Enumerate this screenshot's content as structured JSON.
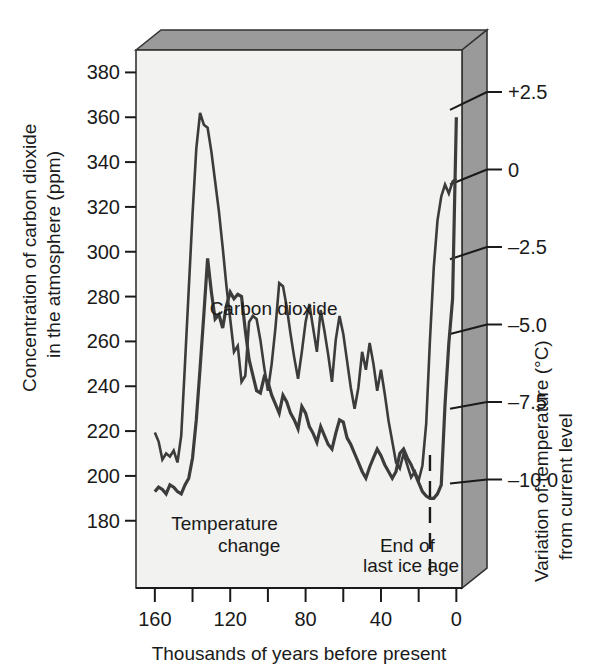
{
  "figure": {
    "background_color": "#ffffff",
    "plot_face_color": "#f2f2f0",
    "box_shade_color": "#9a9a9a",
    "line_color": "#3c3c3c",
    "axis_color": "#1a1a1a"
  },
  "chart_data": {
    "type": "line",
    "title": "",
    "xlabel": "Thousands of years before present",
    "ylabel": "Concentration of carbon dioxide in the atmosphere (ppm)",
    "ylabel_line1": "Concentration of carbon dioxide",
    "ylabel_line2": "in the atmosphere (ppm)",
    "y2label": "Variation of temperature (°C) from current level",
    "y2label_line1": "Variation of temperature (°C)",
    "y2label_line2": "from current level",
    "xlim": [
      170,
      -3
    ],
    "x_inverted": true,
    "ylim": [
      150,
      390
    ],
    "y2lim": [
      -13.5,
      4.5
    ],
    "grid": false,
    "legend": "inline-labels",
    "xticks": [
      160,
      140,
      120,
      100,
      80,
      60,
      40,
      20,
      0
    ],
    "xticklabels": [
      "160",
      "",
      "120",
      "",
      "80",
      "",
      "40",
      "",
      "0"
    ],
    "yticks": [
      180,
      200,
      220,
      240,
      260,
      280,
      300,
      320,
      340,
      360,
      380
    ],
    "yticklabels": [
      "180",
      "200",
      "220",
      "240",
      "260",
      "280",
      "300",
      "320",
      "340",
      "360",
      "380"
    ],
    "y2ticks": [
      2.5,
      0,
      -2.5,
      -5.0,
      -7.5,
      -10.0
    ],
    "y2ticklabels": [
      "+2.5",
      "0",
      "–2.5",
      "–5.0",
      "–7.5",
      "–10.0"
    ],
    "annotations": [
      {
        "text": "Carbon dioxide",
        "x": 97,
        "y": 272
      },
      {
        "text": "Temperature",
        "x": 123,
        "y": 176
      },
      {
        "text": "change",
        "x": 110,
        "y": 166
      },
      {
        "text": "End of",
        "x": 26,
        "y": 166
      },
      {
        "text": "last ice age",
        "x": 24,
        "y": 157
      }
    ],
    "marker_line": {
      "label": "End of last ice age",
      "x": 14,
      "style": "dashed"
    },
    "series": [
      {
        "name": "Carbon dioxide",
        "axis": "left",
        "unit": "ppm",
        "x": [
          160,
          158,
          156,
          154,
          152,
          150,
          148,
          146,
          144,
          142,
          140,
          138,
          136,
          134,
          132,
          130,
          128,
          126,
          124,
          122,
          120,
          118,
          116,
          114,
          112,
          110,
          108,
          106,
          104,
          102,
          100,
          98,
          96,
          94,
          92,
          90,
          88,
          86,
          84,
          82,
          80,
          78,
          76,
          74,
          72,
          70,
          68,
          66,
          64,
          62,
          60,
          58,
          56,
          54,
          52,
          50,
          48,
          46,
          44,
          42,
          40,
          38,
          36,
          34,
          32,
          30,
          28,
          26,
          24,
          22,
          20,
          18,
          16,
          14,
          12,
          10,
          8,
          6,
          4,
          2,
          0
        ],
        "values": [
          193,
          195,
          194,
          192,
          196,
          195,
          193,
          192,
          196,
          199,
          208,
          225,
          248,
          272,
          297,
          282,
          270,
          272,
          266,
          276,
          282,
          279,
          281,
          280,
          265,
          252,
          245,
          238,
          237,
          244,
          242,
          236,
          232,
          228,
          236,
          233,
          228,
          225,
          221,
          231,
          228,
          222,
          219,
          215,
          222,
          218,
          214,
          212,
          219,
          225,
          224,
          217,
          214,
          210,
          206,
          202,
          199,
          204,
          208,
          212,
          209,
          205,
          202,
          199,
          202,
          210,
          212,
          208,
          205,
          201,
          197,
          193,
          191,
          190,
          190,
          192,
          196,
          232,
          259,
          279,
          360
        ]
      },
      {
        "name": "Temperature change",
        "axis": "right",
        "unit": "°C",
        "x": [
          160,
          158,
          156,
          154,
          152,
          150,
          148,
          146,
          144,
          142,
          140,
          138,
          136,
          134,
          132,
          130,
          128,
          126,
          124,
          122,
          120,
          118,
          116,
          114,
          112,
          110,
          108,
          106,
          104,
          102,
          100,
          98,
          96,
          94,
          92,
          90,
          88,
          86,
          84,
          82,
          80,
          78,
          76,
          74,
          72,
          70,
          68,
          66,
          64,
          62,
          60,
          58,
          56,
          54,
          52,
          50,
          48,
          46,
          44,
          42,
          40,
          38,
          36,
          34,
          32,
          30,
          28,
          26,
          24,
          22,
          20,
          18,
          16,
          14,
          12,
          10,
          8,
          6,
          4,
          2,
          0
        ],
        "values": [
          -8.3,
          -8.6,
          -9.2,
          -9.0,
          -9.1,
          -8.9,
          -9.3,
          -8.4,
          -6.0,
          -3.5,
          -1.0,
          1.2,
          2.4,
          2.0,
          1.9,
          1.1,
          0.1,
          -0.9,
          -2.1,
          -3.4,
          -4.5,
          -5.6,
          -5.4,
          -6.6,
          -6.4,
          -4.6,
          -4.4,
          -4.5,
          -5.2,
          -6.1,
          -6.9,
          -6.0,
          -4.8,
          -3.3,
          -3.4,
          -4.1,
          -5.0,
          -5.8,
          -6.5,
          -5.6,
          -4.6,
          -4.0,
          -4.8,
          -5.6,
          -4.2,
          -4.9,
          -5.7,
          -6.6,
          -5.2,
          -4.4,
          -5.0,
          -5.9,
          -6.8,
          -7.5,
          -6.8,
          -5.6,
          -6.2,
          -5.3,
          -6.0,
          -6.9,
          -6.2,
          -7.0,
          -7.9,
          -8.6,
          -9.3,
          -9.5,
          -9.0,
          -9.4,
          -9.8,
          -9.6,
          -9.9,
          -9.4,
          -8.0,
          -5.2,
          -2.8,
          -1.2,
          -0.4,
          0.0,
          -0.3,
          0.1,
          0.2
        ]
      }
    ]
  }
}
